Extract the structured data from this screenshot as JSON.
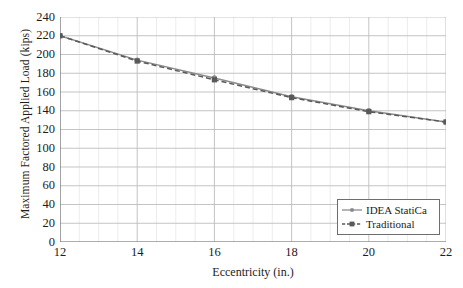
{
  "chart_data": {
    "type": "line",
    "title": "",
    "xlabel": "Eccentricity (in.)",
    "ylabel": "Maximum Factored Applied Load (kips)",
    "x": [
      12,
      14,
      16,
      18,
      20,
      22
    ],
    "xlim": [
      12,
      22
    ],
    "ylim": [
      0,
      240
    ],
    "xticks": [
      "12",
      "14",
      "16",
      "18",
      "20",
      "22"
    ],
    "yticks": [
      "0",
      "20",
      "40",
      "60",
      "80",
      "100",
      "120",
      "140",
      "160",
      "180",
      "200",
      "220",
      "240"
    ],
    "grid": "major and minor, both axes",
    "legend_position": "lower right inside axes",
    "series": [
      {
        "name": "IDEA StatiCa",
        "values": [
          220,
          194,
          175,
          155,
          140,
          128
        ],
        "color": "#8c8c8c",
        "style": "solid",
        "marker": "circle"
      },
      {
        "name": "Traditional",
        "values": [
          220,
          193,
          173,
          154,
          139,
          128
        ],
        "color": "#595959",
        "style": "dashed",
        "marker": "square"
      }
    ]
  },
  "legend": {
    "items": [
      {
        "label": "IDEA StatiCa"
      },
      {
        "label": "Traditional"
      }
    ]
  },
  "colors": {
    "series_1": "#8c8c8c",
    "series_2": "#595959",
    "axis": "#7a7a7a",
    "grid_major": "#b9b9b9",
    "grid_minor": "#dcdcdc",
    "text": "#1c1c1c"
  }
}
